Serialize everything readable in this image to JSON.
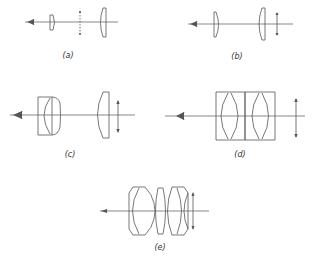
{
  "figure": {
    "panels": [
      {
        "id": "a",
        "label": "(a)",
        "description": "Simple two-lens eyepiece with field stop between lenses"
      },
      {
        "id": "b",
        "label": "(b)",
        "description": "Two-lens eyepiece with image plane outside (after field lens)"
      },
      {
        "id": "c",
        "label": "(c)",
        "description": "Achromatic doublet eye lens with single field lens"
      },
      {
        "id": "d",
        "label": "(d)",
        "description": "Symmetrical eyepiece of two cemented doublets"
      },
      {
        "id": "e",
        "label": "(e)",
        "description": "Multi-element wide-field eyepiece"
      }
    ]
  },
  "colors": {
    "line": "#555555",
    "background": "#ffffff",
    "text": "#333333"
  }
}
